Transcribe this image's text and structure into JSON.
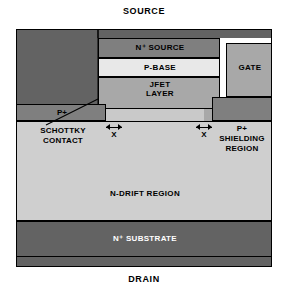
{
  "diagram": {
    "title_top": "SOURCE",
    "title_bottom": "DRAIN",
    "type": "semiconductor-cross-section",
    "device": "SiC MOSFET with integrated Schottky contact"
  },
  "regions": {
    "n_source": "N⁺ SOURCE",
    "p_base": "P-BASE",
    "jfet": "JFET\nLAYER",
    "gate": "GATE",
    "oxide": "OXIDE",
    "p_plus": "P+",
    "p_shielding": "P+\nSHIELDING\nREGION",
    "schottky": "SCHOTTKY\nCONTACT",
    "n_drift": "N-DRIFT REGION",
    "n_substrate": "N⁺ SUBSTRATE"
  },
  "dimensions": {
    "left_x_label": "X",
    "right_x_label": "X"
  },
  "colors": {
    "metal": "#636363",
    "n_source": "#7f7f7f",
    "p_base": "#e8e8e8",
    "jfet": "#a8a8a8",
    "gate": "#a8a8a8",
    "oxide": "#ffffff",
    "p_plus": "#7f7f7f",
    "n_drift": "#cfcfcf",
    "n_substrate": "#636363",
    "outline": "#000000",
    "background": "#ffffff"
  }
}
